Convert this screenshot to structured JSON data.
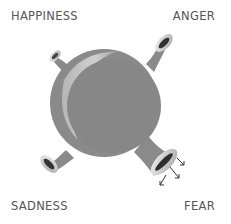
{
  "labels": {
    "top_left": "HAPPINESS",
    "top_right": "ANGER",
    "bottom_left": "SADNESS",
    "bottom_right": "FEAR"
  },
  "diagram": {
    "body": "sphere",
    "outlets": [
      {
        "emotion": "HAPPINESS",
        "position": "top-left",
        "size": "small"
      },
      {
        "emotion": "ANGER",
        "position": "top-right",
        "size": "medium"
      },
      {
        "emotion": "SADNESS",
        "position": "bottom-left",
        "size": "medium"
      },
      {
        "emotion": "FEAR",
        "position": "bottom-right",
        "size": "large",
        "emitting": true
      }
    ],
    "colors": {
      "sphere": "#8a8a8a",
      "sphere_highlight": "#c4c4c4",
      "funnel_rim": "#dcdcdc",
      "funnel_opening": "#333333",
      "label": "#555555",
      "arrow": "#333333"
    }
  }
}
